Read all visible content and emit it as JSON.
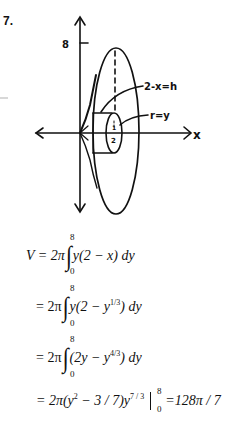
{
  "problem": {
    "number": "7."
  },
  "diagram": {
    "y_tick_label": "8",
    "x_axis_label": "x",
    "shell_height_label": "2-x=h",
    "radius_label": "r=y",
    "cylinder_end_label_top": "1",
    "cylinder_end_label_bottom": "2"
  },
  "equations": [
    {
      "lhs": "V = 2π",
      "upper": "8",
      "lower": "0",
      "integrand": "y(2 − x) dy"
    },
    {
      "lhs": "= 2π",
      "upper": "8",
      "lower": "0",
      "integrand_pre": "y(2 − y",
      "integrand_exp": "1/3",
      "integrand_post": ") dy"
    },
    {
      "lhs": "= 2π",
      "upper": "8",
      "lower": "0",
      "integrand_pre": "(2y − y",
      "integrand_exp": "4/3",
      "integrand_post": ") dy"
    },
    {
      "lhs_pre": "= 2π(y",
      "lhs_exp1": "2",
      "lhs_mid": " − 3 / 7)y",
      "lhs_exp2": "7 / 3",
      "eval_upper": "8",
      "eval_lower": "0",
      "result": "=128π / 7"
    }
  ]
}
